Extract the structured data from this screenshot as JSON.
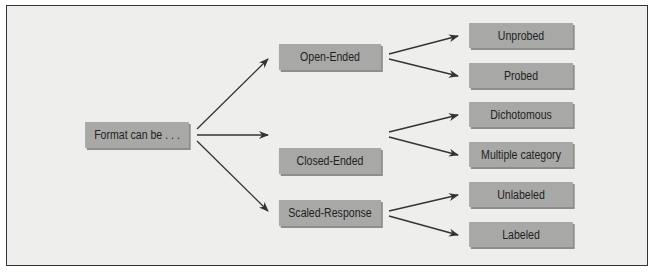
{
  "diagram": {
    "type": "tree",
    "root": {
      "label": "Format can be . . ."
    },
    "branches": [
      {
        "label": "Open-Ended",
        "children": [
          {
            "label": "Unprobed"
          },
          {
            "label": "Probed"
          }
        ]
      },
      {
        "label": "Closed-Ended",
        "children": [
          {
            "label": "Dichotomous"
          },
          {
            "label": "Multiple category"
          }
        ]
      },
      {
        "label": "Scaled-Response",
        "children": [
          {
            "label": "Unlabeled"
          },
          {
            "label": "Labeled"
          }
        ]
      }
    ]
  },
  "colors": {
    "background": "#eeeeec",
    "box_fill": "#a8a8a6",
    "box_shadow": "#8d8d8b",
    "arrow": "#333333",
    "frame_border": "#333333"
  }
}
